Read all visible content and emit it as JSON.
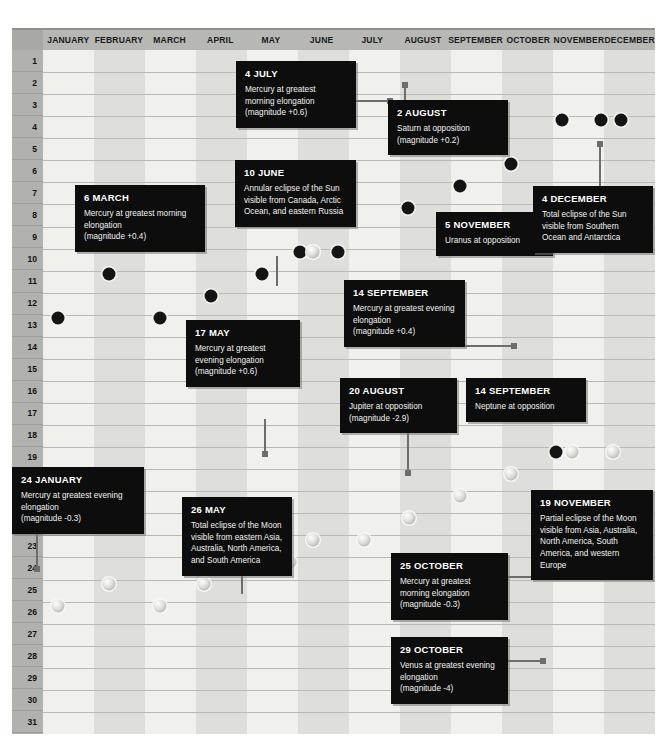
{
  "calendar": {
    "months": [
      "JANUARY",
      "FEBRUARY",
      "MARCH",
      "APRIL",
      "MAY",
      "JUNE",
      "JULY",
      "AUGUST",
      "SEPTEMBER",
      "OCTOBER",
      "NOVEMBER",
      "DECEMBER"
    ],
    "days": [
      "1",
      "2",
      "3",
      "4",
      "5",
      "6",
      "7",
      "8",
      "9",
      "10",
      "11",
      "12",
      "13",
      "14",
      "15",
      "16",
      "17",
      "18",
      "19",
      "20",
      "21",
      "22",
      "23",
      "24",
      "25",
      "26",
      "27",
      "28",
      "29",
      "30",
      "31"
    ],
    "colors": {
      "callout_bg": "#0d0d0d",
      "callout_text": "#ffffff",
      "header_bg": "#b7b7b3",
      "daycol_bg": "#b1b1ad",
      "col_light": "#f0f0ed",
      "col_dark": "#dededa",
      "new_moon": "#141414",
      "leader": "#6d6d69"
    }
  },
  "events": [
    {
      "id": "jan-24",
      "title": "24 JANUARY",
      "body": "Mercury at greatest evening elongation",
      "magnitude": "(magnitude -0.3)",
      "box": {
        "left": 12,
        "top": 467,
        "width": 132
      }
    },
    {
      "id": "mar-6",
      "title": "6 MARCH",
      "body": "Mercury at greatest morning elongation",
      "magnitude": "(magnitude +0.4)",
      "box": {
        "left": 75,
        "top": 185,
        "width": 130
      }
    },
    {
      "id": "may-17",
      "title": "17 MAY",
      "body": "Mercury at greatest evening elongation",
      "magnitude": "(magnitude +0.6)",
      "box": {
        "left": 186,
        "top": 320,
        "width": 114
      }
    },
    {
      "id": "may-26",
      "title": "26 MAY",
      "body": "Total eclipse of the Moon visible from eastern Asia, Australia, North America, and South America",
      "magnitude": "",
      "box": {
        "left": 182,
        "top": 497,
        "width": 110
      }
    },
    {
      "id": "jun-10",
      "title": "10 JUNE",
      "body": "Annular eclipse of the Sun visible from Canada, Arctic Ocean, and eastern Russia",
      "magnitude": "",
      "box": {
        "left": 235,
        "top": 160,
        "width": 121
      }
    },
    {
      "id": "jul-4",
      "title": "4 JULY",
      "body": "Mercury at greatest morning elongation",
      "magnitude": "(magnitude +0.6)",
      "box": {
        "left": 236,
        "top": 61,
        "width": 120
      }
    },
    {
      "id": "aug-2",
      "title": "2 AUGUST",
      "body": "Saturn at opposition",
      "magnitude": "(magnitude +0.2)",
      "box": {
        "left": 388,
        "top": 100,
        "width": 120
      }
    },
    {
      "id": "aug-20",
      "title": "20 AUGUST",
      "body": "Jupiter at opposition",
      "magnitude": "(magnitude -2.9)",
      "box": {
        "left": 340,
        "top": 378,
        "width": 117
      }
    },
    {
      "id": "sep-14-mercury",
      "title": "14 SEPTEMBER",
      "body": "Mercury at greatest evening elongation",
      "magnitude": "(magnitude +0.4)",
      "box": {
        "left": 344,
        "top": 280,
        "width": 121
      }
    },
    {
      "id": "sep-14-neptune",
      "title": "14 SEPTEMBER",
      "body": "Neptune at opposition",
      "magnitude": "",
      "box": {
        "left": 466,
        "top": 378,
        "width": 120
      }
    },
    {
      "id": "oct-25",
      "title": "25 OCTOBER",
      "body": "Mercury at greatest morning elongation",
      "magnitude": "(magnitude -0.3)",
      "box": {
        "left": 391,
        "top": 553,
        "width": 117
      }
    },
    {
      "id": "oct-29",
      "title": "29 OCTOBER",
      "body": "Venus at greatest evening elongation",
      "magnitude": "(magnitude -4)",
      "box": {
        "left": 391,
        "top": 637,
        "width": 117
      }
    },
    {
      "id": "nov-5",
      "title": "5 NOVEMBER",
      "body": "Uranus at opposition",
      "magnitude": "",
      "box": {
        "left": 436,
        "top": 212,
        "width": 117
      }
    },
    {
      "id": "nov-19",
      "title": "19 NOVEMBER",
      "body": "Partial eclipse of the Moon visible from Asia, Australia, North America, South America, and western Europe",
      "magnitude": "",
      "box": {
        "left": 531,
        "top": 490,
        "width": 122
      }
    },
    {
      "id": "dec-4",
      "title": "4 DECEMBER",
      "body": "Total eclipse of the Sun visible from Southern Ocean and Antarctica",
      "magnitude": "",
      "box": {
        "left": 533,
        "top": 186,
        "width": 120
      }
    }
  ],
  "markers": [
    {
      "type": "new-moon",
      "x": 58,
      "y": 318
    },
    {
      "type": "new-moon",
      "x": 109,
      "y": 274
    },
    {
      "type": "new-moon",
      "x": 160,
      "y": 318
    },
    {
      "type": "new-moon",
      "x": 211,
      "y": 296
    },
    {
      "type": "new-moon",
      "x": 262,
      "y": 274
    },
    {
      "type": "new-moon",
      "x": 300,
      "y": 252
    },
    {
      "type": "full-moon",
      "x": 313,
      "y": 252
    },
    {
      "type": "new-moon",
      "x": 338,
      "y": 252
    },
    {
      "type": "new-moon",
      "x": 408,
      "y": 208
    },
    {
      "type": "new-moon",
      "x": 460,
      "y": 186
    },
    {
      "type": "new-moon",
      "x": 511,
      "y": 164
    },
    {
      "type": "new-moon",
      "x": 562,
      "y": 120
    },
    {
      "type": "new-moon",
      "x": 601,
      "y": 120
    },
    {
      "type": "new-moon",
      "x": 621,
      "y": 120
    },
    {
      "type": "full-moon",
      "x": 58,
      "y": 606
    },
    {
      "type": "full-moon",
      "x": 109,
      "y": 584
    },
    {
      "type": "full-moon",
      "x": 160,
      "y": 606
    },
    {
      "type": "full-moon",
      "x": 204,
      "y": 584
    },
    {
      "type": "full-moon",
      "x": 256,
      "y": 562
    },
    {
      "type": "new-moon",
      "x": 275,
      "y": 562
    },
    {
      "type": "full-moon",
      "x": 290,
      "y": 562
    },
    {
      "type": "full-moon",
      "x": 313,
      "y": 540
    },
    {
      "type": "full-moon",
      "x": 364,
      "y": 540
    },
    {
      "type": "full-moon",
      "x": 409,
      "y": 518
    },
    {
      "type": "full-moon",
      "x": 460,
      "y": 496
    },
    {
      "type": "full-moon",
      "x": 511,
      "y": 474
    },
    {
      "type": "new-moon",
      "x": 556,
      "y": 452
    },
    {
      "type": "full-moon",
      "x": 572,
      "y": 452
    },
    {
      "type": "full-moon",
      "x": 613,
      "y": 452
    }
  ],
  "leaders": [
    {
      "orient": "h",
      "x": 330,
      "y": 100,
      "len": 60,
      "dot": "right"
    },
    {
      "orient": "h",
      "x": 481,
      "y": 252,
      "len": 49,
      "dot": "left"
    },
    {
      "orient": "h",
      "x": 456,
      "y": 345,
      "len": 58,
      "dot": "right"
    },
    {
      "orient": "h",
      "x": 503,
      "y": 576,
      "len": 40,
      "dot": "right"
    },
    {
      "orient": "h",
      "x": 503,
      "y": 660,
      "len": 40,
      "dot": "right"
    },
    {
      "orient": "v",
      "x": 407,
      "y": 427,
      "len": 46,
      "dot": "bottom"
    },
    {
      "orient": "v",
      "x": 264,
      "y": 419,
      "len": 35,
      "dot": "bottom"
    },
    {
      "orient": "v",
      "x": 36,
      "y": 521,
      "len": 48,
      "dot": "bottom"
    },
    {
      "orient": "v",
      "x": 599,
      "y": 144,
      "len": 62,
      "dot": "top"
    },
    {
      "orient": "v",
      "x": 404,
      "y": 85,
      "len": 28,
      "dot": "top"
    },
    {
      "orient": "v",
      "x": 276,
      "y": 256,
      "len": 30,
      "dot": "none"
    },
    {
      "orient": "v",
      "x": 241,
      "y": 572,
      "len": 22,
      "dot": "none"
    }
  ]
}
